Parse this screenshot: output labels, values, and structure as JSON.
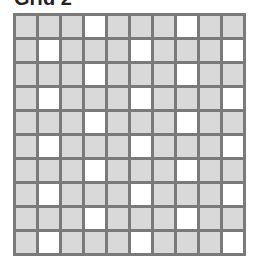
{
  "title": "Grid 2",
  "grid": {
    "rows": 10,
    "cols": 10,
    "colors": {
      "shaded": "#d9d9d9",
      "white": "#ffffff",
      "border": "#7a7a7a"
    },
    "white_cells_by_row": [
      [
        4,
        8
      ],
      [
        2,
        6,
        10
      ],
      [
        4,
        8
      ],
      [
        2,
        6,
        10
      ],
      [
        4,
        8
      ],
      [
        2,
        6,
        10
      ],
      [
        4,
        8
      ],
      [
        2,
        6,
        10
      ],
      [
        4,
        8
      ],
      [
        2,
        6,
        10
      ]
    ]
  }
}
